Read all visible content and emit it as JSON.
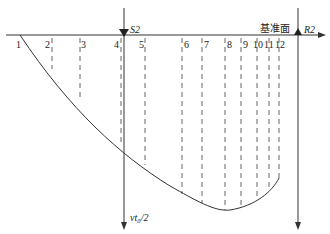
{
  "diagram": {
    "baseline_label": "基准面",
    "left_line_label": "S2",
    "right_line_label": "R2",
    "vertical_axis_label": "vt₀/2",
    "stations": [
      {
        "label": "1",
        "x": 20
      },
      {
        "label": "2",
        "x": 52
      },
      {
        "label": "3",
        "x": 80
      },
      {
        "label": "4",
        "x": 121
      },
      {
        "label": "5",
        "x": 145
      },
      {
        "label": "6",
        "x": 182
      },
      {
        "label": "7",
        "x": 202
      },
      {
        "label": "8",
        "x": 225
      },
      {
        "label": "9",
        "x": 241
      },
      {
        "label": "10",
        "x": 257
      },
      {
        "label": "11",
        "x": 269
      },
      {
        "label": "12",
        "x": 279
      }
    ],
    "colors": {
      "line": "#333333",
      "dashed": "#555555",
      "background": "#ffffff"
    }
  }
}
